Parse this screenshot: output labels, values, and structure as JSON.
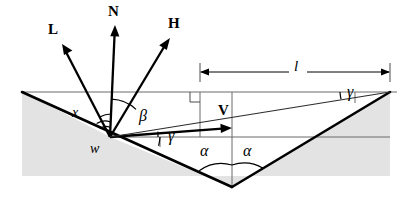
{
  "figure": {
    "background_color": "#ffffff",
    "groove_fill_color": "#e3e3e3",
    "stroke_color": "#000000",
    "thin_line_color": "#6b6b6b"
  },
  "vectors": [
    {
      "name": "light-vector",
      "label": "L",
      "tail_x": 110,
      "tail_y": 137,
      "tip_x": 62,
      "tip_y": 44
    },
    {
      "name": "normal-vector",
      "label": "N",
      "tail_x": 110,
      "tail_y": 137,
      "tip_x": 115,
      "tip_y": 25
    },
    {
      "name": "half-vector",
      "label": "H",
      "tail_x": 110,
      "tail_y": 137,
      "tip_x": 170,
      "tip_y": 38
    },
    {
      "name": "view-vector",
      "label": "V",
      "tail_x": 110,
      "tail_y": 137,
      "tip_x": 232,
      "tip_y": 128
    }
  ],
  "labels": {
    "L": "L",
    "N": "N",
    "H": "H",
    "V": "V",
    "x": "x",
    "w": "w",
    "l": "l",
    "beta": "β",
    "gamma_left": "γ",
    "gamma_right": "γ",
    "alpha_left": "α",
    "alpha_right": "α"
  },
  "angles": [
    {
      "name": "beta-angle",
      "symbol": "β",
      "vertex": "w",
      "between": [
        "N",
        "H"
      ]
    },
    {
      "name": "gamma-angle-left",
      "symbol": "γ",
      "vertex": "w",
      "between": [
        "horizontal",
        "V"
      ]
    },
    {
      "name": "gamma-angle-right",
      "symbol": "γ",
      "vertex": "right-peak",
      "between": [
        "horizontal",
        "V"
      ]
    },
    {
      "name": "alpha-angle-left",
      "symbol": "α",
      "vertex": "groove-bottom",
      "between": [
        "left-facet",
        "vertical"
      ]
    },
    {
      "name": "alpha-angle-right",
      "symbol": "α",
      "vertex": "groove-bottom",
      "between": [
        "vertical",
        "right-facet"
      ]
    }
  ],
  "dimension": {
    "name": "length-l",
    "label": "l",
    "start_x": 200,
    "end_x": 390,
    "y": 72
  },
  "points": {
    "w": {
      "label": "w",
      "x": 110,
      "y": 137
    },
    "groove_bottom": {
      "x": 232,
      "y": 187
    },
    "left_top": {
      "x": 22,
      "y": 92
    },
    "right_peak": {
      "x": 390,
      "y": 92
    }
  },
  "markers": {
    "right_angle": {
      "name": "right-angle-marker",
      "x": 200,
      "y": 92
    }
  }
}
